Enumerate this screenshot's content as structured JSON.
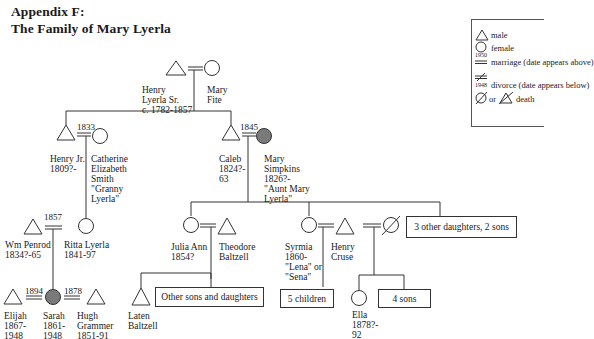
{
  "title": {
    "line1": "Appendix F:",
    "line2": "The Family of Mary Lyerla"
  },
  "legend": {
    "items": [
      {
        "symbol": "triangle-icon",
        "label": "male"
      },
      {
        "symbol": "circle-icon",
        "label": "female"
      },
      {
        "symbol": "marriage-icon",
        "year_example": "1950",
        "label": "marriage (date appears above)"
      },
      {
        "symbol": "divorce-icon",
        "year_example": "1948",
        "label": "divorce (date appears below)"
      },
      {
        "symbol": "death-icon",
        "label_or": "or",
        "label": "death"
      }
    ]
  },
  "people": {
    "henry_sr": {
      "name": "Henry Lyerla Sr.",
      "line1": "Henry",
      "line2": "Lyerla Sr.",
      "line3": "c. 1782-1857",
      "sex": "male"
    },
    "mary_fite": {
      "name": "Mary Fite",
      "line1": "Mary",
      "line2": "Fite",
      "sex": "female"
    },
    "henry_jr": {
      "name": "Henry Jr.",
      "line1": "Henry Jr.",
      "line2": "1809?-",
      "sex": "male"
    },
    "catherine": {
      "name": "Catherine Elizabeth Smith",
      "line1": "Catherine",
      "line2": "Elizabeth",
      "line3": "Smith",
      "line4": "\"Granny",
      "line5": "Lyerla\"",
      "sex": "female"
    },
    "caleb": {
      "name": "Caleb",
      "line1": "Caleb",
      "line2": "1824?-",
      "line3": "63",
      "sex": "male"
    },
    "mary_simpkins": {
      "name": "Mary Simpkins",
      "line1": "Mary",
      "line2": "Simpkins",
      "line3": "1826?-",
      "line4": "\"Aunt Mary",
      "line5": "Lyerla\"",
      "sex": "female",
      "highlighted": true
    },
    "wm_penrod": {
      "name": "Wm Penrod",
      "line1": "Wm Penrod",
      "line2": "1834?-65",
      "sex": "male"
    },
    "ritta": {
      "name": "Ritta Lyerla",
      "line1": "Ritta Lyerla",
      "line2": "1841-97",
      "sex": "female"
    },
    "julia_ann": {
      "name": "Julia Ann",
      "line1": "Julia Ann",
      "line2": "1854?",
      "sex": "female"
    },
    "theodore": {
      "name": "Theodore Baltzell",
      "line1": "Theodore",
      "line2": "Baltzell",
      "sex": "male"
    },
    "syrmia": {
      "name": "Syrmia",
      "line1": "Syrmia",
      "line2": "1860-",
      "line3": "\"Lena\" or",
      "line4": "\"Sena\"",
      "sex": "female"
    },
    "henry_cruse": {
      "name": "Henry Cruse",
      "line1": "Henry",
      "line2": "Cruse",
      "sex": "male"
    },
    "elijah": {
      "name": "Elijah",
      "line1": "Elijah",
      "line2": "1867-",
      "line3": "1948",
      "sex": "male"
    },
    "sarah": {
      "name": "Sarah",
      "line1": "Sarah",
      "line2": "1861-",
      "line3": "1948",
      "sex": "female",
      "highlighted": true
    },
    "hugh": {
      "name": "Hugh Grammer",
      "line1": "Hugh",
      "line2": "Grammer",
      "line3": "1851-91",
      "sex": "male"
    },
    "laten": {
      "name": "Laten Baltzell",
      "line1": "Laten",
      "line2": "Baltzell",
      "sex": "male"
    },
    "ella": {
      "name": "Ella",
      "line1": "Ella",
      "line2": "1878?-",
      "line3": "92",
      "sex": "female"
    }
  },
  "marriages": {
    "henry_jr_catherine": "1833",
    "caleb_mary": "1845",
    "penrod_ritta": "1857",
    "elijah_sarah": "1894",
    "sarah_hugh": "1878"
  },
  "boxes": {
    "other_daughters": "3 other daughters, 2 sons",
    "other_sons_daughters": "Other sons and daughters",
    "five_children": "5 children",
    "four_sons": "4 sons"
  },
  "colors": {
    "line": "#333333",
    "highlight_fill": "#7a7a7a"
  }
}
